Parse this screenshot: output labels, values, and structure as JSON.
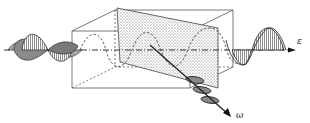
{
  "diagram": {
    "type": "wave-optics-crystal",
    "labels": {
      "output_axis": "ε",
      "deflected_axis": "ω"
    },
    "elements": [
      "incident-wave-left",
      "crystal-box",
      "dotted-slab",
      "transmitted-wave-right",
      "deflected-wave"
    ],
    "colors": {
      "line": "#333333",
      "fill": "#9a9a9a",
      "slab": "#d8d8d8"
    }
  }
}
